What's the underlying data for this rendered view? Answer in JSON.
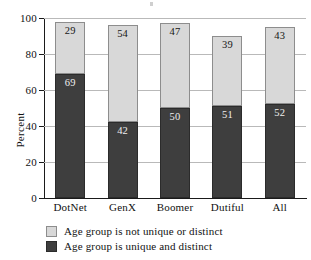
{
  "chart_data": {
    "type": "bar",
    "subtype": "stacked-bar",
    "title": "",
    "xlabel": "",
    "ylabel": "Percent",
    "ylim": [
      0,
      100
    ],
    "yticks": [
      0,
      20,
      40,
      60,
      80,
      100
    ],
    "grid": true,
    "legend_position": "bottom-left",
    "categories": [
      "DotNet",
      "GenX",
      "Boomer",
      "Dutiful",
      "All"
    ],
    "series": [
      {
        "name": "Age group is unique and distinct",
        "color": "#3e3e3e",
        "values": [
          69,
          42,
          50,
          51,
          52
        ]
      },
      {
        "name": "Age group is not unique or distinct",
        "color": "#d8d8d8",
        "values": [
          29,
          54,
          47,
          39,
          43
        ]
      }
    ],
    "totals": [
      98,
      96,
      97,
      90,
      95
    ]
  },
  "axis": {
    "y_title": "Percent",
    "y_tick_labels": [
      "0",
      "20",
      "40",
      "60",
      "80",
      "100"
    ],
    "x_tick_labels": [
      "DotNet",
      "GenX",
      "Boomer",
      "Dutiful",
      "All"
    ]
  },
  "bars": [
    {
      "category": "DotNet",
      "dark_label": "69",
      "light_label": "29"
    },
    {
      "category": "GenX",
      "dark_label": "42",
      "light_label": "54"
    },
    {
      "category": "Boomer",
      "dark_label": "50",
      "light_label": "47"
    },
    {
      "category": "Dutiful",
      "dark_label": "51",
      "light_label": "39"
    },
    {
      "category": "All",
      "dark_label": "52",
      "light_label": "43"
    }
  ],
  "legend": {
    "items": [
      {
        "label": "Age group is not unique or distinct",
        "color": "#d8d8d8"
      },
      {
        "label": "Age group is unique and distinct",
        "color": "#3e3e3e"
      }
    ]
  }
}
